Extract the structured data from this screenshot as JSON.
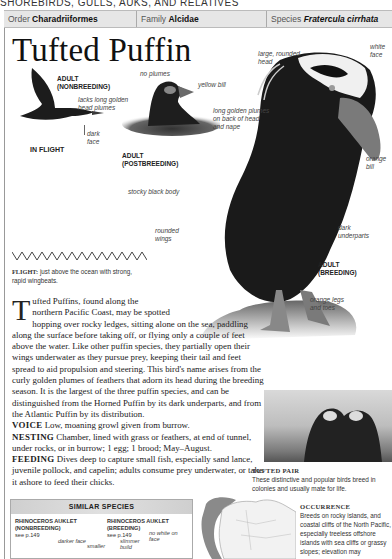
{
  "section_title": "SHOREBIRDS, GULLS, AUKS, AND RELATIVES",
  "taxonomy": {
    "order_label": "Order",
    "order_value": "Charadriiformes",
    "family_label": "Family",
    "family_value": "Alcidae",
    "species_label": "Species",
    "species_value": "Fratercula cirrhata"
  },
  "title": "Tufted Puffin",
  "illustrations": {
    "flight": {
      "caption_top": "ADULT",
      "caption_bottom": "(NONBREEDING)",
      "label_plumes": "lacks long golden head plumes",
      "label_plumes_1": "lacks long golden",
      "label_plumes_2": "head plumes",
      "label_face_1": "dark",
      "label_face_2": "face",
      "caption_flight": "IN FLIGHT"
    },
    "postbreeding": {
      "label_plumes": "no plumes",
      "label_bill": "yellow bill",
      "caption_top": "ADULT",
      "caption_bottom": "(POSTBREEDING)"
    },
    "breeding": {
      "label_head_1": "large, rounded",
      "label_head_2": "head",
      "label_face_1": "white",
      "label_face_2": "face",
      "label_plumes_1": "long golden plumes",
      "label_plumes_2": "on back of head",
      "label_plumes_3": "and nape",
      "label_bill_1": "orange",
      "label_bill_2": "bill",
      "label_body": "stocky black body",
      "label_wings_1": "rounded",
      "label_wings_2": "wings",
      "label_underparts_1": "dark",
      "label_underparts_2": "underparts",
      "caption_top": "ADULT",
      "caption_bottom": "(BREEDING)",
      "label_legs_1": "orange legs",
      "label_legs_2": "and toes"
    }
  },
  "flight": {
    "label": "FLIGHT:",
    "text_1": "just above the ocean with strong,",
    "text_2": "rapid wingbeats."
  },
  "description": {
    "dropcap": "T",
    "line1": "ufted Puffins, found along the",
    "line2": "northern Pacific Coast, may be spotted",
    "rest": "hopping over rocky ledges, sitting alone on the sea, paddling along the surface before taking off, or flying only a couple of feet above the water. Like other puffin species, they partially open their wings underwater as they pursue prey, keeping their tail and feet spread to aid propulsion and steering. This bird's name arises from the curly golden plumes of feathers that adorn its head during the breeding season. It is the largest of the three puffin species, and can be distinguished from the Horned Puffin by its dark underparts, and from the Atlantic Puffin by its distribution."
  },
  "voice": {
    "label": "VOICE",
    "text": "Low, moaning growl given from burrow."
  },
  "nesting": {
    "label": "NESTING",
    "text": "Chamber, lined with grass or feathers, at end of tunnel, under rocks, or in burrow; 1 egg; 1 brood; May–August."
  },
  "feeding": {
    "label": "FEEDING",
    "text": "Dives deep to capture small fish, especially sand lance, juvenile pollock, and capelin; adults consume prey underwater, or take it ashore to feed their chicks."
  },
  "photo": {
    "caption_title": "TUFTED PAIR",
    "caption_text": "These distinctive and popular birds breed in colonies and usually mate for life."
  },
  "similar_species": {
    "header": "SIMILAR SPECIES",
    "items": [
      {
        "name": "RHINOCEROS AUKLET",
        "plumage": "(NONBREEDING)",
        "page": "see p.149",
        "notes": [
          "darker face",
          "smaller"
        ]
      },
      {
        "name": "RHINOCEROS AUKLET",
        "plumage": "(BREEDING)",
        "page": "see p.149",
        "notes": [
          "slimmer build",
          "no white on face"
        ]
      }
    ]
  },
  "occurrence": {
    "title": "OCCURRENCE",
    "text": "Breeds on rocky islands, and coastal cliffs of the North Pacific, especially treeless offshore islands with sea cliffs or grassy slopes; elevation may"
  }
}
